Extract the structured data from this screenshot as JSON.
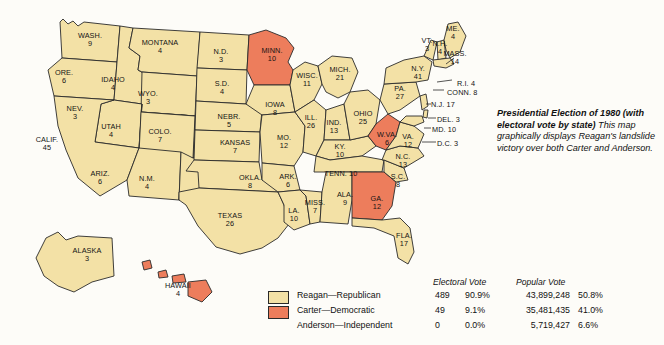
{
  "figure": {
    "title_bold": "Presidential Election of 1980 (with electoral vote by state)",
    "caption_body": "This map graphically displays Reagan's landslide victory over both Carter and Anderson."
  },
  "colors": {
    "reagan_republican": "#f3e1a6",
    "carter_democratic": "#ed7d5c",
    "background": "#fdfcf8",
    "outline": "#2a2a2a"
  },
  "legend": {
    "headers": {
      "electoral_vote": "Electoral Vote",
      "popular_vote": "Popular Vote"
    },
    "rows": [
      {
        "candidate": "Reagan—Republican",
        "swatch": "reagan",
        "electoral_votes": "489",
        "electoral_pct": "90.9%",
        "popular_votes": "43,899,248",
        "popular_pct": "50.8%"
      },
      {
        "candidate": "Carter—Democratic",
        "swatch": "carter",
        "electoral_votes": "49",
        "electoral_pct": "9.1%",
        "popular_votes": "35,481,435",
        "popular_pct": "41.0%"
      },
      {
        "candidate": "Anderson—Independent",
        "swatch": "none",
        "electoral_votes": "0",
        "electoral_pct": "0.0%",
        "popular_votes": "5,719,427",
        "popular_pct": "6.6%"
      }
    ]
  },
  "map": {
    "type": "choropleth-electoral-map",
    "region": "United States",
    "states": [
      {
        "abbr": "WASH.",
        "ev": "9",
        "winner": "reagan",
        "lx": 90,
        "ly": 40
      },
      {
        "abbr": "ORE.",
        "ev": "6",
        "winner": "reagan",
        "lx": 64,
        "ly": 77
      },
      {
        "abbr": "IDAHO",
        "ev": "4",
        "winner": "reagan",
        "lx": 113,
        "ly": 84
      },
      {
        "abbr": "MONTANA",
        "ev": "4",
        "winner": "reagan",
        "lx": 160,
        "ly": 47
      },
      {
        "abbr": "WYO.",
        "ev": "3",
        "winner": "reagan",
        "lx": 148,
        "ly": 98
      },
      {
        "abbr": "NEV.",
        "ev": "3",
        "winner": "reagan",
        "lx": 75,
        "ly": 113
      },
      {
        "abbr": "UTAH",
        "ev": "4",
        "winner": "reagan",
        "lx": 111,
        "ly": 131
      },
      {
        "abbr": "COLO.",
        "ev": "7",
        "winner": "reagan",
        "lx": 160,
        "ly": 136
      },
      {
        "abbr": "CALIF.",
        "ev": "45",
        "winner": "reagan",
        "lx": 47,
        "ly": 144
      },
      {
        "abbr": "ARIZ.",
        "ev": "6",
        "winner": "reagan",
        "lx": 100,
        "ly": 178
      },
      {
        "abbr": "N.M.",
        "ev": "4",
        "winner": "reagan",
        "lx": 147,
        "ly": 183
      },
      {
        "abbr": "N.D.",
        "ev": "3",
        "winner": "reagan",
        "lx": 221,
        "ly": 56
      },
      {
        "abbr": "S.D.",
        "ev": "4",
        "winner": "reagan",
        "lx": 222,
        "ly": 88
      },
      {
        "abbr": "NEBR.",
        "ev": "5",
        "winner": "reagan",
        "lx": 229,
        "ly": 121
      },
      {
        "abbr": "KANSAS",
        "ev": "7",
        "winner": "reagan",
        "lx": 235,
        "ly": 147
      },
      {
        "abbr": "OKLA.",
        "ev": "8",
        "winner": "reagan",
        "lx": 250,
        "ly": 182
      },
      {
        "abbr": "TEXAS",
        "ev": "26",
        "winner": "reagan",
        "lx": 230,
        "ly": 220
      },
      {
        "abbr": "MINN.",
        "ev": "10",
        "winner": "carter",
        "lx": 272,
        "ly": 55
      },
      {
        "abbr": "IOWA",
        "ev": "8",
        "winner": "reagan",
        "lx": 275,
        "ly": 109
      },
      {
        "abbr": "MO.",
        "ev": "12",
        "winner": "reagan",
        "lx": 284,
        "ly": 142
      },
      {
        "abbr": "ARK.",
        "ev": "6",
        "winner": "reagan",
        "lx": 288,
        "ly": 181
      },
      {
        "abbr": "LA.",
        "ev": "10",
        "winner": "reagan",
        "lx": 294,
        "ly": 215
      },
      {
        "abbr": "WISC.",
        "ev": "11",
        "winner": "reagan",
        "lx": 307,
        "ly": 80
      },
      {
        "abbr": "ILL.",
        "ev": "26",
        "winner": "reagan",
        "lx": 311,
        "ly": 122
      },
      {
        "abbr": "MISS.",
        "ev": "7",
        "winner": "reagan",
        "lx": 315,
        "ly": 207
      },
      {
        "abbr": "MICH.",
        "ev": "21",
        "winner": "reagan",
        "lx": 340,
        "ly": 74
      },
      {
        "abbr": "IND.",
        "ev": "13",
        "winner": "reagan",
        "lx": 334,
        "ly": 127
      },
      {
        "abbr": "KY.",
        "ev": "10",
        "winner": "reagan",
        "lx": 340,
        "ly": 151
      },
      {
        "abbr": "TENN.",
        "ev": "10",
        "winner": "reagan",
        "lx": 341,
        "ly": 174,
        "inline": true
      },
      {
        "abbr": "ALA.",
        "ev": "9",
        "winner": "reagan",
        "lx": 345,
        "ly": 199
      },
      {
        "abbr": "OHIO",
        "ev": "25",
        "winner": "reagan",
        "lx": 363,
        "ly": 118
      },
      {
        "abbr": "GA.",
        "ev": "12",
        "winner": "carter",
        "lx": 377,
        "ly": 203
      },
      {
        "abbr": "FLA.",
        "ev": "17",
        "winner": "reagan",
        "lx": 404,
        "ly": 240
      },
      {
        "abbr": "W.VA.",
        "ev": "6",
        "winner": "carter",
        "lx": 387,
        "ly": 139
      },
      {
        "abbr": "S.C.",
        "ev": "8",
        "winner": "reagan",
        "lx": 398,
        "ly": 181
      },
      {
        "abbr": "N.C.",
        "ev": "13",
        "winner": "reagan",
        "lx": 403,
        "ly": 161
      },
      {
        "abbr": "VA.",
        "ev": "12",
        "winner": "reagan",
        "lx": 408,
        "ly": 141
      },
      {
        "abbr": "PA.",
        "ev": "27",
        "winner": "reagan",
        "lx": 400,
        "ly": 93
      },
      {
        "abbr": "N.Y.",
        "ev": "41",
        "winner": "reagan",
        "lx": 418,
        "ly": 73
      },
      {
        "abbr": "VT.",
        "ev": "3",
        "winner": "reagan",
        "lx": 427,
        "ly": 45
      },
      {
        "abbr": "N.H.",
        "ev": "4",
        "winner": "reagan",
        "lx": 440,
        "ly": 48
      },
      {
        "abbr": "ME.",
        "ev": "4",
        "winner": "reagan",
        "lx": 453,
        "ly": 33
      },
      {
        "abbr": "ALASKA",
        "ev": "3",
        "winner": "reagan",
        "lx": 87,
        "ly": 255
      },
      {
        "abbr": "HAWAII",
        "ev": "4",
        "winner": "carter",
        "lx": 178,
        "ly": 290
      }
    ],
    "callout_states": [
      {
        "abbr": "MASS.",
        "ev": "14",
        "winner": "reagan",
        "lx": 455,
        "ly": 58
      },
      {
        "abbr": "R.I. 4",
        "ev": "",
        "winner": "reagan",
        "lx": 457,
        "ly": 84,
        "single": true
      },
      {
        "abbr": "CONN. 8",
        "ev": "",
        "winner": "reagan",
        "lx": 447,
        "ly": 93,
        "single": true
      },
      {
        "abbr": "N.J. 17",
        "ev": "",
        "winner": "reagan",
        "lx": 431,
        "ly": 105,
        "single": true
      },
      {
        "abbr": "DEL. 3",
        "ev": "",
        "winner": "reagan",
        "lx": 437,
        "ly": 120,
        "single": true
      },
      {
        "abbr": "MD. 10",
        "ev": "",
        "winner": "reagan",
        "lx": 432,
        "ly": 130,
        "single": true
      },
      {
        "abbr": "D.C. 3",
        "ev": "",
        "winner": "reagan",
        "lx": 437,
        "ly": 144,
        "single": true
      }
    ]
  }
}
